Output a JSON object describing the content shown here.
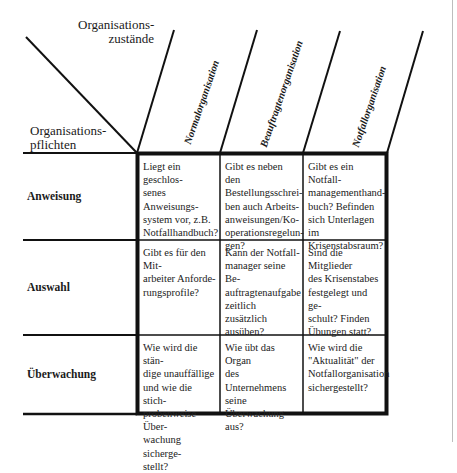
{
  "header": {
    "top_label": "Organisations-\nzustände",
    "left_label": "Organisations-\npflichten"
  },
  "columns": [
    {
      "label": "Normalorganisation"
    },
    {
      "label": "Beauftragtenorganisation"
    },
    {
      "label": "Notfallorganisation"
    }
  ],
  "rows": [
    {
      "label": "Anweisung",
      "cells": [
        "Liegt ein geschlos-\nsenes Anweisungs-\nsystem vor, z.B.\nNotfallhandbuch?",
        "Gibt es neben den\nBestellungsschrei-\nben auch Arbeits-\nanweisungen/Ko-\noperationsregelun-\ngen?",
        "Gibt es ein Notfall-\nmanagementhand-\nbuch? Befinden\nsich Unterlagen im\nKrisenstabsraum?"
      ]
    },
    {
      "label": "Auswahl",
      "cells": [
        "Gibt es für den Mit-\narbeiter Anforde-\nrungsprofile?",
        "Kann der Notfall-\nmanager seine Be-\nauftragtenaufgabe\nzeitlich zusätzlich\nausüben?",
        "Sind die Mitglieder\ndes Krisenstabes\nfestgelegt und ge-\nschult? Finden\nÜbungen statt?"
      ]
    },
    {
      "label": "Überwachung",
      "cells": [
        "Wie wird die stän-\ndige unauffällige\nund wie die stich-\nprobenweise Über-\nwachung sicherge-\nstellt?",
        "Wie übt das Organ\ndes Unternehmens\nseine Überwachung\naus?",
        "Wie wird die\n\"Aktualität\" der\nNotfallorganisation\nsichergestellt?"
      ]
    }
  ],
  "colors": {
    "line": "#111111",
    "page_edge": "#bdbdbd",
    "background": "#ffffff"
  }
}
